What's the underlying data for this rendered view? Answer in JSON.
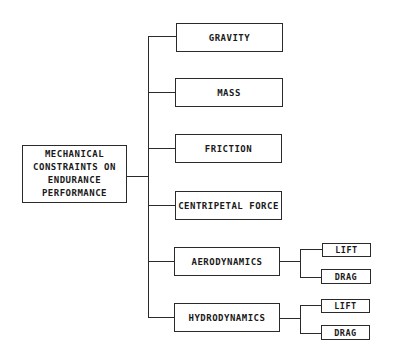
{
  "diagram": {
    "root": {
      "label_lines": [
        "MECHANICAL",
        "CONSTRAINTS ON",
        "ENDURANCE",
        "PERFORMANCE"
      ]
    },
    "children": [
      {
        "label": "GRAVITY"
      },
      {
        "label": "MASS"
      },
      {
        "label": "FRICTION"
      },
      {
        "label": "CENTRIPETAL FORCE"
      },
      {
        "label": "AERODYNAMICS",
        "children": [
          {
            "label": "LIFT"
          },
          {
            "label": "DRAG"
          }
        ]
      },
      {
        "label": "HYDRODYNAMICS",
        "children": [
          {
            "label": "LIFT"
          },
          {
            "label": "DRAG"
          }
        ]
      }
    ]
  }
}
